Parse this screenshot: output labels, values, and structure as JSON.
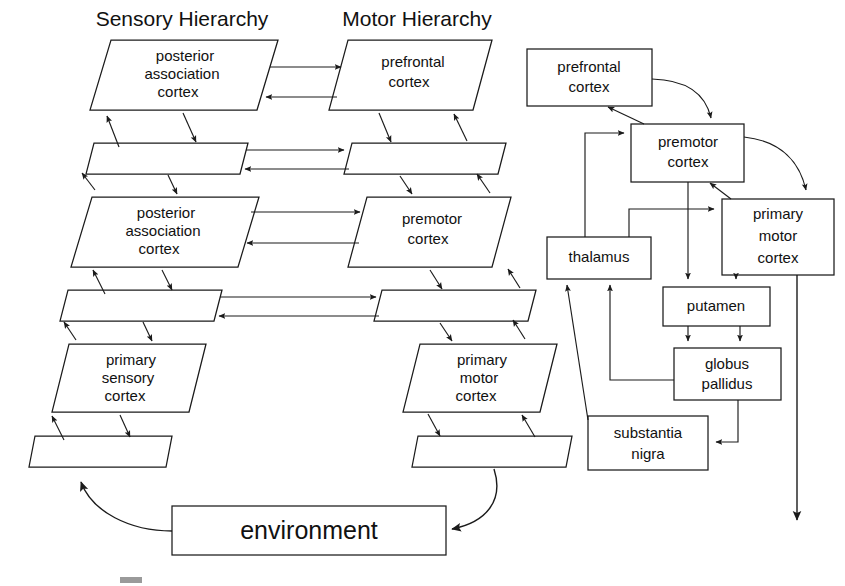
{
  "figure": {
    "kind": "block-diagram",
    "background_color": "#ffffff",
    "line_color": "#1b1b1b",
    "titles": {
      "sensory": "Sensory Hierarchy",
      "motor": "Motor Hierarchy"
    },
    "environment_label": "environment"
  },
  "sensory_column": {
    "nodes": [
      {
        "id": "pac-top",
        "label_line1": "posterior",
        "label_line2": "association",
        "label_line3": "cortex"
      },
      {
        "id": "pac-mid",
        "label_line1": "posterior",
        "label_line2": "association",
        "label_line3": "cortex"
      },
      {
        "id": "psc",
        "label_line1": "primary",
        "label_line2": "sensory",
        "label_line3": "cortex"
      }
    ],
    "connector_bars": 3
  },
  "motor_column": {
    "nodes": [
      {
        "id": "pfc",
        "label_line1": "prefrontal",
        "label_line2": "cortex"
      },
      {
        "id": "pmc",
        "label_line1": "premotor",
        "label_line2": "cortex"
      },
      {
        "id": "m1",
        "label_line1": "primary",
        "label_line2": "motor",
        "label_line3": "cortex"
      }
    ],
    "connector_bars": 3
  },
  "basal_ganglia": {
    "nodes": [
      {
        "id": "r-prefrontal",
        "label_line1": "prefrontal",
        "label_line2": "cortex"
      },
      {
        "id": "r-premotor",
        "label_line1": "premotor",
        "label_line2": "cortex"
      },
      {
        "id": "r-m1",
        "label_line1": "primary",
        "label_line2": "motor",
        "label_line3": "cortex"
      },
      {
        "id": "r-thalamus",
        "label_line1": "thalamus"
      },
      {
        "id": "r-putamen",
        "label_line1": "putamen"
      },
      {
        "id": "r-globus",
        "label_line1": "globus",
        "label_line2": "pallidus"
      },
      {
        "id": "r-nigra",
        "label_line1": "substantia",
        "label_line2": "nigra"
      }
    ]
  },
  "caption": {
    "text": ""
  }
}
